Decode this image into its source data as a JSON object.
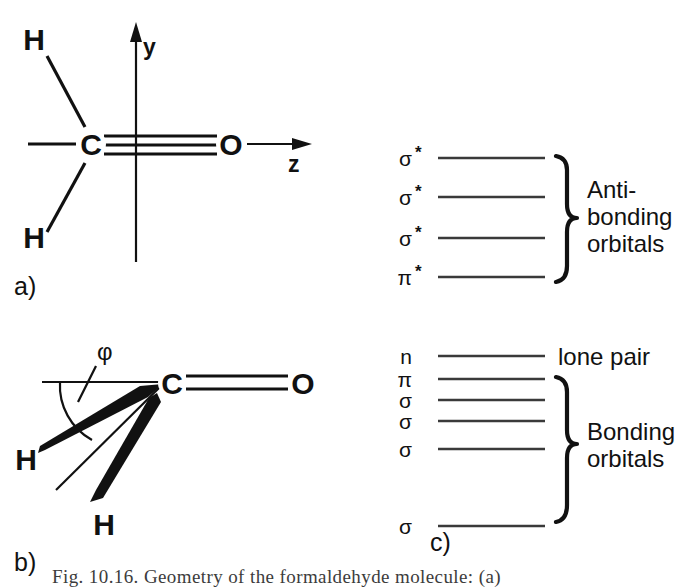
{
  "figure": {
    "panel_a": {
      "tag": "a)",
      "atoms": [
        {
          "name": "hydrogen-upper",
          "label": "H"
        },
        {
          "name": "hydrogen-lower",
          "label": "H"
        },
        {
          "name": "carbon",
          "label": "C"
        },
        {
          "name": "oxygen",
          "label": "O"
        }
      ],
      "axes": [
        {
          "name": "y-axis",
          "label": "y"
        },
        {
          "name": "z-axis",
          "label": "z"
        }
      ],
      "bond_order_co": 3
    },
    "panel_b": {
      "tag": "b)",
      "atoms": [
        {
          "name": "hydrogen-wedge-left",
          "label": "H"
        },
        {
          "name": "hydrogen-wedge-lower",
          "label": "H"
        },
        {
          "name": "carbon",
          "label": "C"
        },
        {
          "name": "oxygen",
          "label": "O"
        }
      ],
      "angle_symbol": "φ",
      "bond_order_co": 2
    },
    "panel_c": {
      "tag": "c)",
      "antibonding": {
        "group_label_line1": "Anti-",
        "group_label_line2": "bonding",
        "group_label_line3": "orbitals",
        "levels": [
          {
            "symbol": "σ",
            "star": "*",
            "y": 38
          },
          {
            "symbol": "σ",
            "star": "*",
            "y": 77
          },
          {
            "symbol": "σ",
            "star": "*",
            "y": 118
          },
          {
            "symbol": "π",
            "star": "*",
            "y": 157
          }
        ]
      },
      "nonbonding": {
        "symbol": "n",
        "star": "",
        "y": 236,
        "annotation": "lone pair"
      },
      "bonding": {
        "group_label_line1": "Bonding",
        "group_label_line2": "orbitals",
        "levels": [
          {
            "symbol": "π",
            "star": "",
            "y": 259
          },
          {
            "symbol": "σ",
            "star": "",
            "y": 280
          },
          {
            "symbol": "σ",
            "star": "",
            "y": 301
          },
          {
            "symbol": "σ",
            "star": "",
            "y": 329
          },
          {
            "symbol": "σ",
            "star": "",
            "y": 406
          }
        ]
      }
    },
    "caption_partial": "Fig. 10.16.   Geometry of the formaldehyde molecule: (a)"
  },
  "colors": {
    "ink": "#111111",
    "level": "#3a3a3a",
    "background": "#ffffff"
  }
}
